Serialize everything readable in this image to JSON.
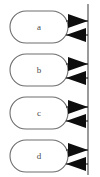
{
  "diagram": {
    "type": "sequence-communication-diagram",
    "canvas": {
      "width": 100,
      "height": 177,
      "background": "#ffffff"
    },
    "colors": {
      "node_stroke": "#6e6e6e",
      "node_fill": "#ffffff",
      "label_text": "#4a4a4a",
      "bus_stroke": "#707070",
      "edge_stroke": "#1a1a1a",
      "arrowhead_fill": "#0d0d0d"
    },
    "bus": {
      "label": "vertical-bus-line",
      "x": 88,
      "y_top": 4,
      "y_bottom": 175
    },
    "nodes": [
      {
        "id": "node-a",
        "label": "a",
        "x": 10,
        "y": 11,
        "width": 58,
        "height": 32,
        "cx": 39,
        "cy": 27
      },
      {
        "id": "node-b",
        "label": "b",
        "x": 10,
        "y": 54,
        "width": 58,
        "height": 32,
        "cx": 39,
        "cy": 70
      },
      {
        "id": "node-c",
        "label": "c",
        "x": 10,
        "y": 97,
        "width": 58,
        "height": 32,
        "cx": 39,
        "cy": 113
      },
      {
        "id": "node-d",
        "label": "d",
        "x": 10,
        "y": 140,
        "width": 58,
        "height": 32,
        "cx": 39,
        "cy": 156
      }
    ],
    "edges": [
      {
        "id": "edge-a-out",
        "from": "node-a",
        "to": "bus",
        "direction": "right",
        "y": 21
      },
      {
        "id": "edge-a-in",
        "from": "bus",
        "to": "node-a",
        "direction": "left",
        "y": 35
      },
      {
        "id": "edge-b-out",
        "from": "node-b",
        "to": "bus",
        "direction": "right",
        "y": 64
      },
      {
        "id": "edge-b-in",
        "from": "bus",
        "to": "node-b",
        "direction": "left",
        "y": 78
      },
      {
        "id": "edge-c-out",
        "from": "node-c",
        "to": "bus",
        "direction": "right",
        "y": 107
      },
      {
        "id": "edge-c-in",
        "from": "bus",
        "to": "node-c",
        "direction": "left",
        "y": 121
      },
      {
        "id": "edge-d-out",
        "from": "node-d",
        "to": "bus",
        "direction": "right",
        "y": 150
      },
      {
        "id": "edge-d-in",
        "from": "bus",
        "to": "node-d",
        "direction": "left",
        "y": 164
      }
    ]
  }
}
